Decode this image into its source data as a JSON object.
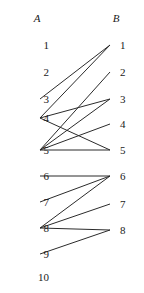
{
  "diagram": {
    "type": "bipartite-graph",
    "width": 144,
    "height": 293,
    "background_color": "#ffffff",
    "edge_color": "#2b2b2b",
    "text_color": "#1a1a1a",
    "columns": {
      "left": {
        "header": "A",
        "header_x": 37,
        "header_y": 18,
        "node_x": 40,
        "labels": [
          "1",
          "2",
          "3",
          "4",
          "5",
          "6",
          "7",
          "8",
          "9",
          "10"
        ],
        "label_x": 27,
        "node_y": [
          45,
          72,
          99,
          118,
          150,
          176,
          202,
          228,
          254,
          277
        ]
      },
      "right": {
        "header": "B",
        "header_x": 116,
        "header_y": 18,
        "node_x": 110,
        "labels": [
          "1",
          "2",
          "3",
          "4",
          "5",
          "6",
          "7",
          "8"
        ],
        "label_x": 120,
        "node_y": [
          45,
          72,
          99,
          124,
          150,
          176,
          204,
          230
        ]
      }
    },
    "edges": [
      {
        "from": "A3",
        "to": "B1",
        "x1": 40,
        "y1": 99,
        "x2": 110,
        "y2": 45
      },
      {
        "from": "A4",
        "to": "B1",
        "x1": 40,
        "y1": 118,
        "x2": 110,
        "y2": 45
      },
      {
        "from": "A4",
        "to": "B3",
        "x1": 40,
        "y1": 118,
        "x2": 110,
        "y2": 99
      },
      {
        "from": "A4",
        "to": "B5",
        "x1": 40,
        "y1": 118,
        "x2": 110,
        "y2": 150
      },
      {
        "from": "A5",
        "to": "B2",
        "x1": 40,
        "y1": 150,
        "x2": 110,
        "y2": 72
      },
      {
        "from": "A5",
        "to": "B3",
        "x1": 40,
        "y1": 150,
        "x2": 110,
        "y2": 99
      },
      {
        "from": "A5",
        "to": "B4",
        "x1": 40,
        "y1": 150,
        "x2": 110,
        "y2": 124
      },
      {
        "from": "A5",
        "to": "B5",
        "x1": 40,
        "y1": 150,
        "x2": 110,
        "y2": 150
      },
      {
        "from": "A6",
        "to": "B6",
        "x1": 40,
        "y1": 176,
        "x2": 110,
        "y2": 176
      },
      {
        "from": "A7",
        "to": "B6",
        "x1": 40,
        "y1": 202,
        "x2": 110,
        "y2": 176
      },
      {
        "from": "A8",
        "to": "B6",
        "x1": 40,
        "y1": 228,
        "x2": 110,
        "y2": 176
      },
      {
        "from": "A8",
        "to": "B7",
        "x1": 40,
        "y1": 228,
        "x2": 110,
        "y2": 204
      },
      {
        "from": "A8",
        "to": "B8",
        "x1": 40,
        "y1": 228,
        "x2": 110,
        "y2": 230
      },
      {
        "from": "A9",
        "to": "B8",
        "x1": 40,
        "y1": 254,
        "x2": 110,
        "y2": 230
      }
    ]
  }
}
